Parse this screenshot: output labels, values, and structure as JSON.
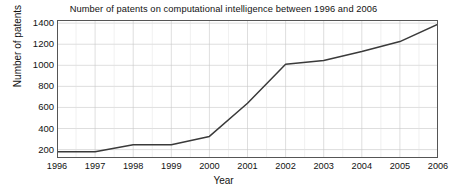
{
  "chart_data": {
    "type": "line",
    "title": "Number of patents on computational intelligence between 1996 and 2006",
    "xlabel": "Year",
    "ylabel": "Number of patents",
    "categories": [
      1996,
      1997,
      1998,
      1999,
      2000,
      2001,
      2002,
      2003,
      2004,
      2005,
      2006
    ],
    "x": [
      1996,
      1997,
      1998,
      1999,
      2000,
      2001,
      2002,
      2003,
      2004,
      2005,
      2006
    ],
    "values": [
      180,
      180,
      245,
      245,
      325,
      640,
      1010,
      1045,
      1130,
      1225,
      1390
    ],
    "series": [
      {
        "name": "Number of patents",
        "values": [
          180,
          180,
          245,
          245,
          325,
          640,
          1010,
          1045,
          1130,
          1225,
          1390
        ]
      }
    ],
    "xlim": [
      1996,
      2006
    ],
    "ylim": [
      120,
      1430
    ],
    "ytick_labels": [
      "200",
      "400",
      "600",
      "800",
      "1000",
      "1200",
      "1400"
    ],
    "ytick_values": [
      200,
      400,
      600,
      800,
      1000,
      1200,
      1400
    ],
    "xtick_labels": [
      "1996",
      "1997",
      "1998",
      "1999",
      "2000",
      "2001",
      "2002",
      "2003",
      "2004",
      "2005",
      "2006"
    ],
    "grid": true,
    "legend": false,
    "line_color": "#3a3a3a",
    "grid_color": "#c8c8c8",
    "axis_color": "#555555",
    "background_color": "#ffffff"
  }
}
